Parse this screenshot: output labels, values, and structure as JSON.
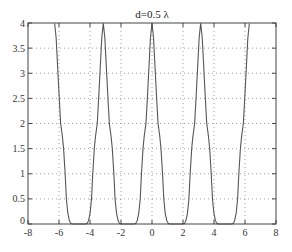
{
  "chart_data": {
    "type": "line",
    "title": "d=0.5 λ",
    "xlabel": "",
    "ylabel": "",
    "xlim": [
      -8,
      8
    ],
    "ylim": [
      0,
      4
    ],
    "xticks": [
      -8,
      -6,
      -4,
      -2,
      0,
      2,
      4,
      6,
      8
    ],
    "xtick_labels": [
      "-8",
      "-6",
      "-4",
      "-2",
      "0",
      "2",
      "4",
      "6",
      "8"
    ],
    "yticks": [
      0,
      0.5,
      1,
      1.5,
      2,
      2.5,
      3,
      3.5,
      4
    ],
    "ytick_labels": [
      "0",
      "0.5",
      "1",
      "1.5",
      "2",
      "2.5",
      "3",
      "3.5",
      "4"
    ],
    "grid": true,
    "grid_style": "dotted",
    "legend": null,
    "series": [
      {
        "name": "array factor",
        "color": "#555555",
        "x_range": [
          -6.28,
          6.28
        ],
        "period": 3.1416,
        "peak_positions": [
          -6.28,
          -3.14,
          0,
          3.14,
          6.28
        ],
        "peak_value": 4,
        "half_period_profile": {
          "x_offset": [
            0,
            0.1,
            0.2,
            0.3,
            0.39,
            0.5,
            0.58,
            0.68,
            0.76,
            0.85,
            0.95,
            1.05,
            1.15,
            1.57
          ],
          "y": [
            4,
            3.7,
            3.1,
            2.5,
            2.0,
            1.75,
            1.5,
            1.0,
            0.5,
            0.22,
            0.07,
            0.01,
            0,
            0
          ]
        }
      }
    ]
  },
  "colors": {
    "axis": "#444444",
    "grid": "#8a8a8a",
    "line": "#555555",
    "background": "#ffffff"
  }
}
